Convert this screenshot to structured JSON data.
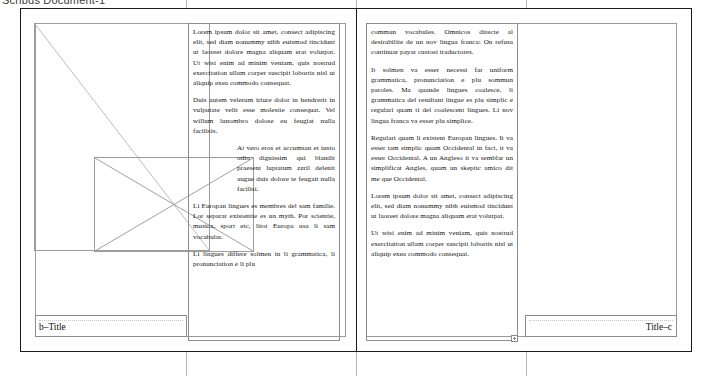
{
  "app": {
    "top_bar_text": "Scribus  Document-1"
  },
  "document": {
    "left_page": {
      "footer_label": "b–Title",
      "image_frame_name": "image-placeholder-frame",
      "picture_frame_name": "picture-object",
      "story": [
        "Lorem ipsum dolor sit amet, consect adipiscing elit, sed diam nonummy nibh euismod tincidunt ut laoreet dolore magna aliquam erat volutpat. Ut wisi enim ad minim veniam, quis nostrud exercitation ullam corper suscipit lobortis nisl ut aliquip exea commodo consequat.",
        "Duis autem velerum iriure dolor in hendrerit in vulputate velit esse molestie consequat. Vel willum lunombro dolose eu feugiat nulla facilisis.",
        "At vero eros et accumsan et iusto odio dignissim qui blandit praesent luptatum zzril delenit augue duis dolore te feugait nulla facilisi.",
        "Li Europan lingues es membres del sam familie. Lor separat existentie es un myth. Por scientie, musica, sport etc, litot Europa usa li sam vocabular.",
        "Li lingues differe solmen in li grammatica, li pronunciation e li plu"
      ]
    },
    "right_page": {
      "footer_label": "Title–c",
      "story": [
        "commun vocabules. Omnicos directe al desirabilite de un nov lingua franca: On refusa continuar payar custosi traductores.",
        "It solmen va esser necessi far uniform grammatica, pronunciation e plu sommun paroles. Ma quande lingues coalesce, li grammatica del resultant lingue es plu simplic e regulari quam ti del coalescent lingues. Li nov lingua franca va esser plu simplice.",
        "Regulari quam li existent Europan lingues. It va esser tam simplic quam Occidental in fact, it va esser Occidental. A un Angleso it va semblar un simplificat Angles, quam un skeptic amico dit me que Occidental.",
        "Lorem ipsum dolor sit amet, consect adipiscing elit, sed diam nonummy nibh euismod tincidunt ut laoreet dolore magna aliquam erat volutpat.",
        "Ut wisi enim ad minim veniam, quis nostrud exercitation ullam corper suscipit lobortis nisl ut aliquip exea commodo consequat."
      ]
    }
  },
  "colors": {
    "page_border": "#1a1a1a",
    "frame_border": "#8d8d8d",
    "guide": "#b9b9b9",
    "text": "#151515",
    "page_background": "#ffffff"
  }
}
